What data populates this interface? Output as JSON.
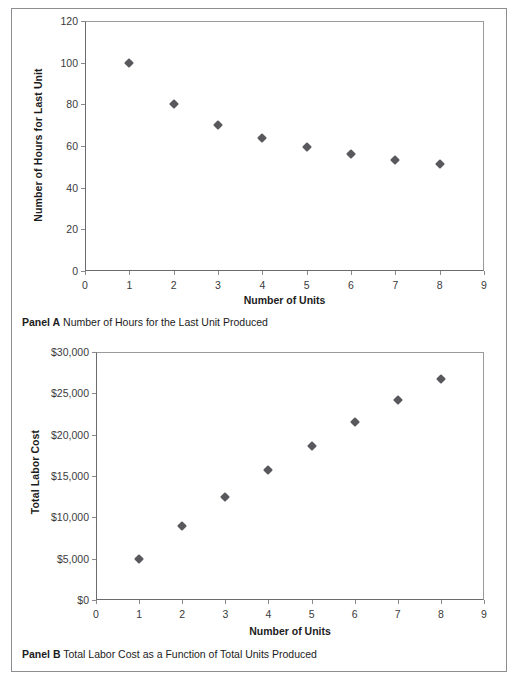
{
  "figure": {
    "background": "#ffffff",
    "frame_color": "#8e8e92",
    "marker_color": "#59595d"
  },
  "panel_a": {
    "caption_label": "Panel A",
    "caption_text": "Number of Hours for the Last Unit Produced",
    "ylabel": "Number of Hours for Last Unit",
    "xlabel": "Number of Units",
    "yticks": [
      "0",
      "20",
      "40",
      "60",
      "80",
      "100",
      "120"
    ],
    "xticks": [
      "0",
      "1",
      "2",
      "3",
      "4",
      "5",
      "6",
      "7",
      "8",
      "9"
    ]
  },
  "panel_b": {
    "caption_label": "Panel B",
    "caption_text": "Total Labor Cost as a Function of Total Units Produced",
    "ylabel": "Total Labor Cost",
    "xlabel": "Number of Units",
    "yticks": [
      "$0",
      "$5,000",
      "$10,000",
      "$15,000",
      "$20,000",
      "$25,000",
      "$30,000"
    ],
    "xticks": [
      "0",
      "1",
      "2",
      "3",
      "4",
      "5",
      "6",
      "7",
      "8",
      "9"
    ]
  },
  "chart_data": [
    {
      "type": "scatter",
      "panel": "Panel A",
      "title": "Number of Hours for the Last Unit Produced",
      "xlabel": "Number of Units",
      "ylabel": "Number of Hours for Last Unit",
      "xlim": [
        0,
        9
      ],
      "ylim": [
        0,
        120
      ],
      "xticks": [
        0,
        1,
        2,
        3,
        4,
        5,
        6,
        7,
        8,
        9
      ],
      "yticks": [
        0,
        20,
        40,
        60,
        80,
        100,
        120
      ],
      "grid": false,
      "legend": false,
      "marker": "diamond",
      "marker_color": "#59595d",
      "x": [
        1,
        2,
        3,
        4,
        5,
        6,
        7,
        8
      ],
      "y": [
        100,
        80,
        70,
        64,
        59.6,
        56.2,
        53.4,
        51.2
      ]
    },
    {
      "type": "scatter",
      "panel": "Panel B",
      "title": "Total Labor Cost as a Function of Total Units Produced",
      "xlabel": "Number of Units",
      "ylabel": "Total Labor Cost",
      "xlim": [
        0,
        9
      ],
      "ylim": [
        0,
        30000
      ],
      "xticks": [
        0,
        1,
        2,
        3,
        4,
        5,
        6,
        7,
        8,
        9
      ],
      "yticks": [
        0,
        5000,
        10000,
        15000,
        20000,
        25000,
        30000
      ],
      "ytick_labels": [
        "$0",
        "$5,000",
        "$10,000",
        "$15,000",
        "$20,000",
        "$25,000",
        "$30,000"
      ],
      "grid": false,
      "legend": false,
      "marker": "diamond",
      "marker_color": "#59595d",
      "x": [
        1,
        2,
        3,
        4,
        5,
        6,
        7,
        8
      ],
      "y": [
        5000,
        9000,
        12500,
        15700,
        18680,
        21490,
        24160,
        26720
      ]
    }
  ]
}
